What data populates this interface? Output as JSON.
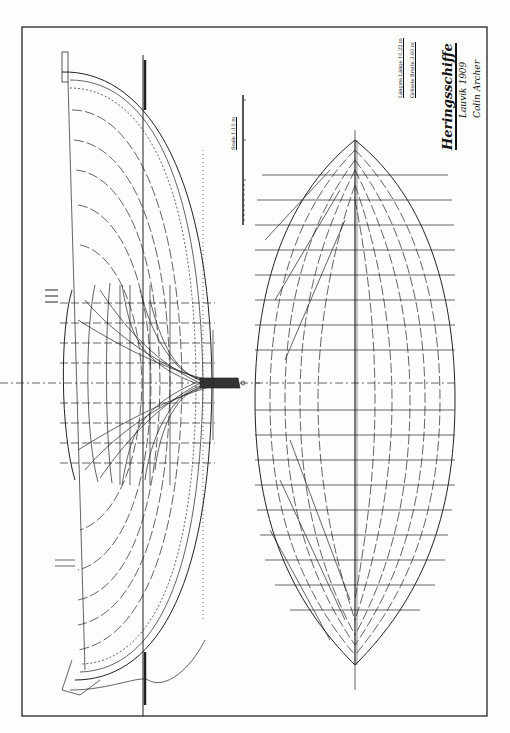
{
  "drawing": {
    "type": "ship lines plan",
    "title": "Heringsschiffe",
    "signature_line1": "Lauvik 1909",
    "signature_line2": "Colin Archer",
    "spec_rows": [
      {
        "label": "Längste Länge",
        "value": "10.22 m"
      },
      {
        "label": "Grösste Breite",
        "value": "3.60 m"
      }
    ],
    "scale_label": "Scale 1:10 m",
    "views": [
      "body-plan",
      "sheer-plan",
      "half-breadth-plan"
    ],
    "colors": {
      "ink": "#111111",
      "paper": "#fdfdfc"
    }
  }
}
